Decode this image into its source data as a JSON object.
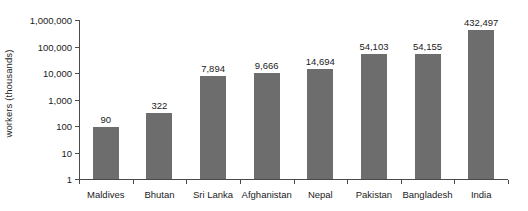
{
  "chart_data": {
    "type": "bar",
    "title": "",
    "subtitle": "",
    "xlabel": "",
    "ylabel": "workers (thousands)",
    "categories": [
      "Maldives",
      "Bhutan",
      "Sri Lanka",
      "Afghanistan",
      "Nepal",
      "Pakistan",
      "Bangladesh",
      "India"
    ],
    "values": [
      90,
      322,
      7894,
      9666,
      14694,
      54103,
      54155,
      432497
    ],
    "value_labels": [
      "90",
      "322",
      "7,894",
      "9,666",
      "14,694",
      "54,103",
      "54,155",
      "432,497"
    ],
    "yscale": "log",
    "ylim": [
      1,
      1000000
    ],
    "yticks": [
      1,
      10,
      100,
      1000,
      10000,
      100000,
      1000000
    ],
    "ytick_labels": [
      "1",
      "10",
      "100",
      "1,000",
      "10,000",
      "100,000",
      "1,000,000"
    ],
    "grid": false,
    "legend": false,
    "bar_color": "#6d6d6d",
    "axis_color": "#4a4a4a",
    "text_color": "#1b1b1b",
    "background_color": "#ffffff"
  }
}
